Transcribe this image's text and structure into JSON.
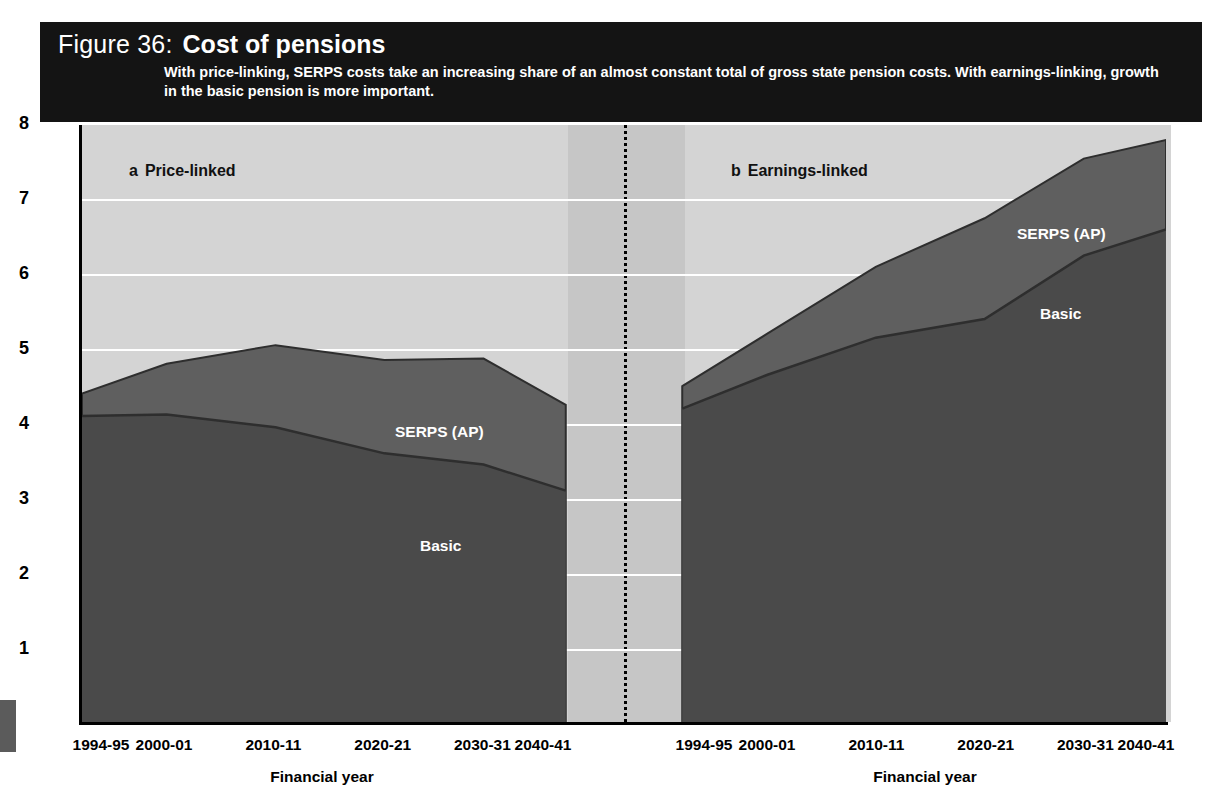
{
  "figure": {
    "number_label": "Figure 36:",
    "title": "Cost of pensions",
    "subtitle": "With price-linking, SERPS costs take an increasing share of an almost constant total of gross state pension costs. With earnings-linking, growth in the basic pension is more important."
  },
  "axes": {
    "y_title": "Gross costs as percentage of GDP",
    "y_ticks": [
      "8",
      "7",
      "6",
      "5",
      "4",
      "3",
      "2",
      "1"
    ],
    "x_title_left": "Financial year",
    "x_title_right": "Financial year",
    "x_ticks": [
      "1994-95",
      "2000-01",
      "2010-11",
      "2020-21",
      "2030-31",
      "2040-41"
    ]
  },
  "panels": [
    {
      "letter": "a",
      "name": "Price-linked"
    },
    {
      "letter": "b",
      "name": "Earnings-linked"
    }
  ],
  "series_labels": {
    "serps_left": "SERPS (AP)",
    "basic_left": "Basic",
    "serps_right": "SERPS (AP)",
    "basic_right": "Basic"
  },
  "colors": {
    "header_bg": "#141414",
    "header_text": "#ffffff",
    "plot_bg": "#d4d4d4",
    "gap_bg": "#c6c6c6",
    "gridline": "#ffffff",
    "basic_fill": "#4a4a4a",
    "serps_fill": "#5f5f5f",
    "series_edge": "#2e2e2e",
    "axis": "#000000"
  },
  "chart_data": {
    "type": "area",
    "title": "Cost of pensions",
    "subtitle": "With price-linking, SERPS costs take an increasing share of an almost constant total of gross state pension costs. With earnings-linking, growth in the basic pension is more important.",
    "xlabel": "Financial year",
    "ylabel": "Gross costs as percentage of GDP",
    "ylim": [
      0,
      8
    ],
    "yticks": [
      1,
      2,
      3,
      4,
      5,
      6,
      7,
      8
    ],
    "grid": true,
    "legend_position": "in-plot annotations",
    "stacked": true,
    "panels": [
      {
        "id": "a",
        "label": "a  Price-linked",
        "x": [
          "1994-95",
          "2000-01",
          "2010-11",
          "2020-21",
          "2030-31",
          "2040-41"
        ],
        "series": [
          {
            "name": "Basic",
            "values": [
              4.1,
              4.12,
              3.95,
              3.6,
              3.45,
              3.1
            ]
          },
          {
            "name": "SERPS (AP)",
            "values": [
              0.3,
              0.68,
              1.1,
              1.25,
              1.42,
              1.15
            ]
          }
        ],
        "totals": [
          4.4,
          4.8,
          5.05,
          4.85,
          4.87,
          4.25
        ]
      },
      {
        "id": "b",
        "label": "b  Earnings-linked",
        "x": [
          "1994-95",
          "2000-01",
          "2010-11",
          "2020-21",
          "2030-31",
          "2040-41"
        ],
        "series": [
          {
            "name": "Basic",
            "values": [
              4.2,
              4.65,
              5.15,
              5.4,
              6.25,
              6.6
            ]
          },
          {
            "name": "SERPS (AP)",
            "values": [
              0.3,
              0.55,
              0.95,
              1.35,
              1.3,
              1.2
            ]
          }
        ],
        "totals": [
          4.5,
          5.2,
          6.1,
          6.75,
          7.55,
          7.8
        ]
      }
    ]
  }
}
